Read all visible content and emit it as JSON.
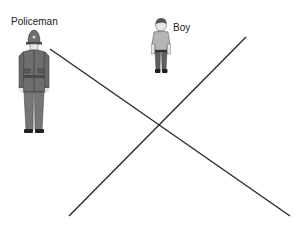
{
  "labels": {
    "policeman": "Policeman",
    "boy": "Boy"
  },
  "figures": [
    {
      "name": "policeman",
      "x": 19,
      "y": 30,
      "w": 30,
      "h": 104
    },
    {
      "name": "boy",
      "x": 150,
      "y": 18,
      "w": 24,
      "h": 57
    }
  ],
  "lines": [
    {
      "name": "line-a",
      "x1": 50,
      "y1": 49,
      "x2": 290,
      "y2": 216
    },
    {
      "name": "line-b",
      "x1": 69,
      "y1": 216,
      "x2": 246,
      "y2": 37
    }
  ],
  "colors": {
    "line": "#2a2a2a",
    "uniform": "#6e6e6e",
    "uniform_dark": "#4a4a4a",
    "shirt": "#b5b5b5",
    "pants": "#5f5f5f",
    "skin": "#e6e6e6"
  }
}
